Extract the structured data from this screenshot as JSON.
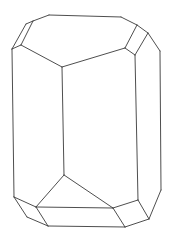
{
  "diagram": {
    "type": "crystal-line-drawing",
    "stroke_color": "#3a3a3a",
    "background": "#ffffff",
    "edges": [
      [
        49,
        15,
        121,
        17
      ],
      [
        121,
        17,
        137,
        25
      ],
      [
        137,
        25,
        148,
        33
      ],
      [
        148,
        33,
        160,
        51
      ],
      [
        160,
        51,
        161,
        190
      ],
      [
        161,
        190,
        149,
        219
      ],
      [
        49,
        15,
        33,
        21
      ],
      [
        33,
        21,
        26,
        24
      ],
      [
        26,
        24,
        12,
        49
      ],
      [
        12,
        49,
        14,
        197
      ],
      [
        33,
        21,
        21,
        45
      ],
      [
        21,
        45,
        12,
        49
      ],
      [
        21,
        45,
        62,
        67
      ],
      [
        62,
        67,
        125,
        48
      ],
      [
        125,
        48,
        137,
        25
      ],
      [
        125,
        48,
        135,
        55
      ],
      [
        135,
        55,
        148,
        33
      ],
      [
        135,
        55,
        138,
        200
      ],
      [
        62,
        67,
        64,
        175
      ],
      [
        64,
        175,
        36,
        207
      ],
      [
        64,
        175,
        113,
        208
      ],
      [
        14,
        197,
        36,
        207
      ],
      [
        36,
        207,
        48,
        226
      ],
      [
        14,
        197,
        27,
        217
      ],
      [
        27,
        217,
        48,
        226
      ],
      [
        36,
        207,
        113,
        208
      ],
      [
        113,
        208,
        138,
        200
      ],
      [
        138,
        200,
        149,
        219
      ],
      [
        113,
        208,
        125,
        227
      ],
      [
        48,
        226,
        125,
        227
      ],
      [
        125,
        227,
        149,
        219
      ]
    ]
  }
}
